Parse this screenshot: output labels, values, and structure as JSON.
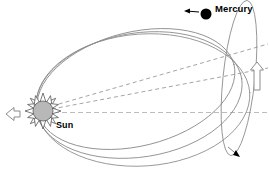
{
  "diagram": {
    "type": "astronomy-orbit-diagram",
    "background_color": "#ffffff",
    "labels": {
      "mercury": "Mercury",
      "sun": "Sun"
    },
    "colors": {
      "orbit_stroke": "#808080",
      "orbit_stroke_dark": "#6e6e6e",
      "dashed_stroke": "#9a9a9a",
      "dashed_stroke_light": "#b9b9b9",
      "sun_fill": "#b8b8b8",
      "sun_stroke": "#555555",
      "planet_fill": "#000000",
      "arrow_stroke": "#8c8c8c",
      "arrow_fill": "#ffffff",
      "text": "#000000"
    },
    "elements": {
      "sun": {
        "name": "Sun",
        "center_x": 43,
        "center_y": 111,
        "core_radius": 10,
        "ray_count": 16,
        "ray_length": 8
      },
      "mercury": {
        "name": "Mercury",
        "center_x": 206,
        "center_y": 14,
        "radius": 5.5
      },
      "orbits": [
        {
          "name": "outer-orbit-ellipse",
          "description": "outermost precessed elliptical orbit"
        },
        {
          "name": "middle-orbit-ellipse",
          "description": "intermediate precessed elliptical orbit"
        },
        {
          "name": "inner-orbit-ellipse",
          "description": "inner precessed elliptical orbit"
        },
        {
          "name": "tilted-orbit-ellipse",
          "description": "narrow inclined orbit plane at right"
        }
      ],
      "axis_lines": [
        {
          "name": "major-axis-upper",
          "style": "dashed",
          "description": "apsidal line rotated upward"
        },
        {
          "name": "major-axis-middle",
          "style": "dashed",
          "description": "apsidal line slightly rotated"
        },
        {
          "name": "major-axis-horizontal",
          "style": "dashed",
          "description": "reference apsidal line"
        }
      ],
      "arrows": [
        {
          "name": "perihelion-shift-arrow-left",
          "direction": "left",
          "x": 12,
          "y": 114
        },
        {
          "name": "precession-arrow-right",
          "direction": "up",
          "x": 257,
          "y": 76
        },
        {
          "name": "mercury-motion-arrow",
          "direction": "left",
          "x": 190,
          "y": 12
        },
        {
          "name": "orbit-direction-arrowhead",
          "direction": "down-right",
          "x": 235,
          "y": 152
        }
      ]
    }
  }
}
